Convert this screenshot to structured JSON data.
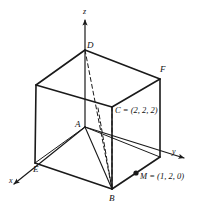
{
  "figure": {
    "background_color": "#ffffff",
    "line_color": "#1a1a1a",
    "axes": {
      "x_label": "x",
      "y_label": "y",
      "z_label": "z"
    },
    "vertices": [
      {
        "name": "A",
        "label": "A"
      },
      {
        "name": "B",
        "label": "B"
      },
      {
        "name": "D",
        "label": "D"
      },
      {
        "name": "E",
        "label": "E"
      },
      {
        "name": "F",
        "label": "F"
      }
    ],
    "annotations": {
      "c_point": "C = (2, 2, 2)",
      "m_point": "M = (1, 2, 0)"
    }
  }
}
